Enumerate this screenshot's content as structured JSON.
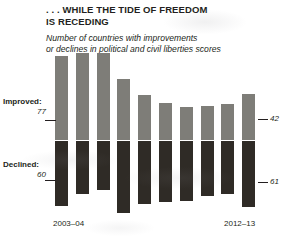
{
  "header": {
    "title": ". . . WHILE THE TIDE OF FREEDOM IS RECEDING",
    "title_line1": ". . . WHILE THE TIDE OF FREEDOM",
    "title_line2": "IS RECEDING",
    "subtitle_line1": "Number of countries with improvements",
    "subtitle_line2": "or declines in political and civil liberties scores"
  },
  "annotations": {
    "improved_caption": "Improved:",
    "improved_value": "77",
    "declined_caption": "Declined:",
    "declined_value": "60",
    "right_improved_value": "42",
    "right_declined_value": "61",
    "x_start": "2003–04",
    "x_end": "2012–13"
  },
  "colors": {
    "improved_bar": "#7e7d78",
    "declined_bar": "#2f2b26",
    "text": "#231f20",
    "background": "#ffffff"
  },
  "chart_data": {
    "type": "bar",
    "title": ". . . WHILE THE TIDE OF FREEDOM IS RECEDING",
    "subtitle": "Number of countries with improvements or declines in political and civil liberties scores",
    "xlabel": "",
    "ylabel": "",
    "grid": false,
    "legend": "none",
    "orientation": "vertical",
    "stacked": false,
    "diverging": true,
    "zero_line_y_px": 140,
    "px_per_unit": 1.09,
    "bar_width_px": 13,
    "bar_pitch_px": 20.8,
    "first_bar_left_px": 55,
    "categories": [
      "2003–04",
      "2004–05",
      "2005–06",
      "2006–07",
      "2007–08",
      "2008–09",
      "2009–10",
      "2010–11",
      "2011–12",
      "2012–13"
    ],
    "series": [
      {
        "name": "Improved",
        "direction": "up",
        "color": "#7e7d78",
        "values": [
          77,
          80,
          80,
          56,
          41,
          34,
          30,
          31,
          33,
          42
        ]
      },
      {
        "name": "Declined",
        "direction": "down",
        "color": "#2f2b26",
        "values": [
          60,
          49,
          45,
          66,
          58,
          56,
          55,
          50,
          49,
          61
        ]
      }
    ],
    "annotations": [
      {
        "text": "Improved:",
        "target": "series-improved",
        "position": "left"
      },
      {
        "text": "77",
        "target": "2003–04 improved",
        "position": "left"
      },
      {
        "text": "Declined:",
        "target": "series-declined",
        "position": "left"
      },
      {
        "text": "60",
        "target": "2003–04 declined",
        "position": "left"
      },
      {
        "text": "42",
        "target": "2012–13 improved",
        "position": "right"
      },
      {
        "text": "61",
        "target": "2012–13 declined",
        "position": "right"
      }
    ],
    "tick_labels_shown": [
      "2003–04",
      "2012–13"
    ]
  }
}
